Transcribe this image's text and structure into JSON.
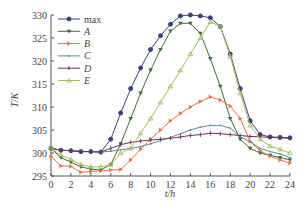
{
  "chart_data": {
    "type": "line",
    "title": "",
    "xlabel": "t/h",
    "ylabel": "T/K",
    "xlim": [
      0,
      24
    ],
    "ylim": [
      295,
      330
    ],
    "xticks": [
      0,
      2,
      4,
      6,
      8,
      10,
      12,
      14,
      16,
      18,
      20,
      22,
      24
    ],
    "yticks": [
      295,
      300,
      305,
      310,
      315,
      320,
      325,
      330
    ],
    "grid": false,
    "legend_position": "upper left",
    "x": [
      0,
      1,
      2,
      3,
      4,
      5,
      6,
      7,
      8,
      9,
      10,
      11,
      12,
      13,
      14,
      15,
      16,
      17,
      18,
      19,
      20,
      21,
      22,
      23,
      24
    ],
    "series": [
      {
        "name": "max",
        "italic": false,
        "color": "#3b3f7a",
        "marker": "circle",
        "values": [
          301,
          300.6,
          300.5,
          300.3,
          300.3,
          300.2,
          303,
          308.7,
          314,
          318.5,
          322.5,
          325.5,
          328,
          329.8,
          330,
          329.8,
          329.4,
          327.5,
          321.5,
          314,
          307,
          304,
          303.5,
          303.4,
          303.3
        ]
      },
      {
        "name": "A",
        "italic": true,
        "color": "#3e6b3a",
        "marker": "triangle-down",
        "values": [
          301,
          299,
          298,
          297,
          296.5,
          296.3,
          297.5,
          302,
          307.5,
          313,
          318,
          322.5,
          326.5,
          328.2,
          328.2,
          326,
          320.5,
          314.5,
          307.5,
          303,
          301,
          300,
          299.5,
          299,
          298.5
        ]
      },
      {
        "name": "B",
        "italic": true,
        "color": "#e8714a",
        "marker": "triangle-right",
        "values": [
          299.3,
          297.2,
          297.1,
          295.8,
          296,
          296.1,
          296.3,
          296.4,
          298.5,
          300.8,
          303,
          305,
          307,
          308.6,
          310,
          311.2,
          312.2,
          311.5,
          310.2,
          307.5,
          302.5,
          300.5,
          299.3,
          298.5,
          297.8
        ]
      },
      {
        "name": "C",
        "italic": true,
        "color": "#5b8a9a",
        "marker": "dot",
        "values": [
          301,
          300.6,
          300.5,
          300.4,
          300.3,
          300.2,
          300.4,
          300.7,
          301,
          301.4,
          302,
          302.7,
          303.4,
          304.2,
          305,
          305.6,
          306,
          306,
          305.4,
          303.5,
          302.5,
          301,
          300.3,
          299.8,
          299
        ]
      },
      {
        "name": "D",
        "italic": true,
        "color": "#6b3558",
        "marker": "plus",
        "values": [
          301,
          300.6,
          300.5,
          300.3,
          300.3,
          300.2,
          301,
          301.8,
          302.3,
          302.6,
          302.8,
          303,
          303.2,
          303.5,
          303.8,
          304,
          304.3,
          304.2,
          304,
          303.8,
          303.6,
          303.5,
          303.4,
          303.3,
          303.2
        ]
      },
      {
        "name": "E",
        "italic": true,
        "color": "#a3c05a",
        "marker": "triangle-up",
        "values": [
          301,
          299.5,
          298.6,
          297.5,
          297,
          297,
          297.5,
          300,
          301,
          304.3,
          307.5,
          311,
          314.5,
          318,
          321.5,
          325,
          328.5,
          327.5,
          321,
          313,
          306,
          303,
          301.5,
          300.8,
          300
        ]
      }
    ]
  },
  "axes": {
    "xlabel": "t/h",
    "ylabel": "T/K"
  }
}
